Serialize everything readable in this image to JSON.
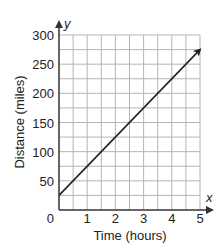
{
  "chart_data": {
    "type": "line",
    "title": "",
    "xlabel": "Time (hours)",
    "ylabel": "Distance (miles)",
    "x_axis_var": "x",
    "y_axis_var": "y",
    "xlim": [
      0,
      5
    ],
    "ylim": [
      0,
      300
    ],
    "x_ticks": [
      1,
      2,
      3,
      4,
      5
    ],
    "y_ticks": [
      50,
      100,
      150,
      200,
      250,
      300
    ],
    "origin_label": "0",
    "grid": true,
    "x_grid_step": 0.5,
    "y_grid_step": 25,
    "legend": null,
    "series": [
      {
        "name": "distance",
        "x": [
          0,
          5
        ],
        "y": [
          25,
          275
        ],
        "arrow_end": true
      }
    ]
  },
  "colors": {
    "grid": "#b5b5b5",
    "axis": "#333333",
    "line": "#222222",
    "text": "#222222"
  }
}
